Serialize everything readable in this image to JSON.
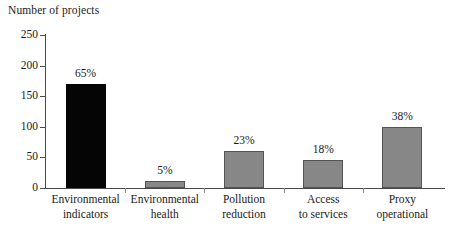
{
  "chart_data": {
    "type": "bar",
    "title": "",
    "ylabel": "Number of projects",
    "xlabel": "",
    "ylim": [
      0,
      250
    ],
    "yticks": [
      0,
      50,
      100,
      150,
      200,
      250
    ],
    "grid": false,
    "legend": "none",
    "categories": [
      "Environmental indicators",
      "Environmental health",
      "Pollution reduction",
      "Access to services",
      "Proxy operational"
    ],
    "category_lines": [
      [
        "Environmental",
        "indicators"
      ],
      [
        "Environmental",
        "health"
      ],
      [
        "Pollution",
        "reduction"
      ],
      [
        "Access",
        "to services"
      ],
      [
        "Proxy",
        "operational"
      ]
    ],
    "values": [
      170,
      12,
      60,
      45,
      99
    ],
    "data_labels": [
      "65%",
      "5%",
      "23%",
      "18%",
      "38%"
    ],
    "bar_colors": [
      "#050505",
      "#878787",
      "#878787",
      "#878787",
      "#878787"
    ],
    "series": [
      {
        "name": "Number of projects",
        "values": [
          170,
          12,
          60,
          45,
          99
        ]
      }
    ]
  },
  "axis": {
    "y_title": "Number of projects",
    "y_tick_labels": [
      "250",
      "200",
      "150",
      "100",
      "50",
      "0"
    ]
  },
  "colors": {
    "bar_black": "#050505",
    "bar_gray": "#878787",
    "axis": "#4a4a4a",
    "text": "#1a1a1a",
    "background": "#ffffff"
  }
}
